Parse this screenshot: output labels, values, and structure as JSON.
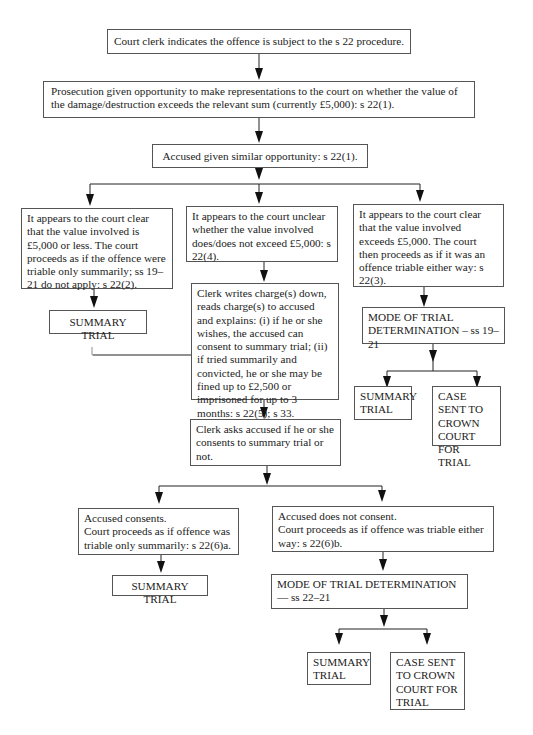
{
  "diagram": {
    "start": "Court clerk indicates the offence is subject to the s 22 procedure.",
    "prosecution": "Prosecution given opportunity to make representations to the court on whether the value of the damage/destruction exceeds the relevant sum (currently £5,000): s 22(1).",
    "accused_opportunity": "Accused given similar opportunity: s 22(1).",
    "branch_left": "It appears to the court clear that the value involved is £5,000 or less. The court proceeds as if the offence were triable only summarily; ss 19–21 do not apply: s 22(2).",
    "branch_middle": "It appears to the court unclear whether the value involved does/does not exceed £5,000: s 22(4).",
    "branch_right": "It appears to the court clear that the value involved exceeds £5,000. The court then proceeds as if it was an offence triable either way: s 22(3).",
    "left_outcome": "SUMMARY TRIAL",
    "clerk_writes": "Clerk writes charge(s) down, reads charge(s) to accused and explains: (i) if he or she wishes, the accused can consent to summary trial; (ii) if tried summarily and convicted, he or she may be fined up to £2,500 or imprisoned for up to 3 months: s 22(5); s 33.",
    "clerk_asks": "Clerk asks accused if he or she consents to summary trial or not.",
    "right_mode": "MODE OF TRIAL DETERMINATION – ss 19–21",
    "right_summary": "SUMMARY TRIAL",
    "right_crown": "CASE SENT TO CROWN COURT FOR TRIAL",
    "consents": "Accused consents.\nCourt proceeds as if offence was triable only summarily: s 22(6)a.",
    "not_consent": "Accused does not consent.\nCourt proceeds as if offence was triable either way: s 22(6)b.",
    "consent_outcome": "SUMMARY TRIAL",
    "bottom_mode": "MODE OF TRIAL DETERMINATION — ss 22–21",
    "bottom_summary": "SUMMARY TRIAL",
    "bottom_crown": "CASE SENT TO CROWN COURT FOR TRIAL"
  }
}
